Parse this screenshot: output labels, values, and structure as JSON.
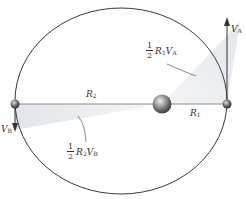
{
  "diagram": {
    "colors": {
      "orbit": "#3a3a3a",
      "axis_line": "#8a8a8a",
      "shade": "#e9ecef",
      "sun": "#6a6a6a",
      "planet": "#555555",
      "arrow": "#333333"
    },
    "labels": {
      "r2": {
        "base": "R",
        "sub": "2"
      },
      "r1": {
        "base": "R",
        "sub": "1"
      },
      "va": {
        "base": "V",
        "sub": "A"
      },
      "vb": {
        "base": "V",
        "sub": "B"
      },
      "area_a": {
        "num": "1",
        "den": "2",
        "r": "R",
        "r_sub": "1",
        "v": "V",
        "v_sub": "A"
      },
      "area_b": {
        "num": "1",
        "den": "2",
        "r": "R",
        "r_sub": "2",
        "v": "V",
        "v_sub": "B"
      }
    },
    "elements": {
      "orbit": "ellipse",
      "sun": "central body (focus)",
      "planet_a": "perihelion point A (right)",
      "planet_b": "aphelion point B (left)"
    }
  }
}
